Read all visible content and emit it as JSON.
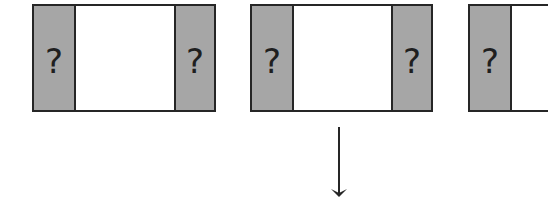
{
  "frames": [
    {
      "left_label": "?",
      "right_label": "?"
    },
    {
      "left_label": "?",
      "right_label": "?"
    },
    {
      "left_label": "?",
      "right_label": ""
    }
  ],
  "colors": {
    "panel_fill": "#a6a6a6",
    "stroke": "#262626",
    "background": "#ffffff"
  },
  "arrow": {
    "direction": "down"
  }
}
